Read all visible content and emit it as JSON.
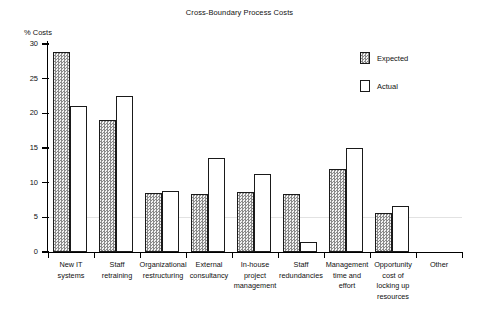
{
  "chart_data": {
    "type": "bar",
    "title": "Cross-Boundary Process Costs",
    "xlabel": "",
    "ylabel": "% Costs",
    "ylim": [
      0,
      30
    ],
    "yticks": [
      "0",
      "5",
      "10",
      "15",
      "20",
      "25",
      "30"
    ],
    "grid": "horizontal gridline at y=5 only",
    "legend_position": "top-right",
    "categories": [
      "New IT systems",
      "Staff retraining",
      "Organizational restructuring",
      "External consultancy",
      "In-house project management",
      "Staff redundancies",
      "Management time and effort",
      "Opportunity cost of locking up resources",
      "Other"
    ],
    "category_lines": [
      [
        "New IT",
        "systems"
      ],
      [
        "Staff",
        "retraining"
      ],
      [
        "Organizational",
        "restructuring"
      ],
      [
        "External",
        "consultancy"
      ],
      [
        "In-house",
        "project",
        "management"
      ],
      [
        "Staff",
        "redundancies"
      ],
      [
        "Management",
        "time and",
        "effort"
      ],
      [
        "Opportunity",
        "cost of",
        "locking up",
        "resources"
      ],
      [
        "Other"
      ]
    ],
    "series": [
      {
        "name": "Expected",
        "fill": "hatched-grey",
        "values": [
          28.8,
          19.0,
          8.5,
          8.3,
          8.7,
          8.4,
          12.0,
          5.6,
          0
        ]
      },
      {
        "name": "Actual",
        "fill": "white",
        "values": [
          21.0,
          22.5,
          8.8,
          13.5,
          11.2,
          1.5,
          15.0,
          6.6,
          0
        ]
      }
    ]
  },
  "legend": {
    "items": [
      {
        "label": "Expected",
        "style": "expected"
      },
      {
        "label": "Actual",
        "style": "actual"
      }
    ]
  },
  "colors": {
    "axis": "#000000",
    "expected_fill": "#d9d9d9",
    "actual_fill": "#ffffff",
    "gridline": "#e2e2e2",
    "text": "#111111"
  }
}
